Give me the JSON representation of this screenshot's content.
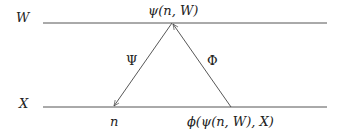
{
  "diagram": {
    "levels": [
      {
        "id": "top",
        "label": "W",
        "y": 23
      },
      {
        "id": "bottom",
        "label": "X",
        "y": 107
      }
    ],
    "nodes": {
      "apex": {
        "label": "ψ(n, W)",
        "x": 172,
        "y": 23
      },
      "left_base": {
        "label": "n",
        "x": 114,
        "y": 107
      },
      "right_base": {
        "label": "ϕ(ψ(n, W), X)",
        "x": 231,
        "y": 107
      }
    },
    "edges": [
      {
        "from": "apex",
        "to": "left_base",
        "label": "Ψ"
      },
      {
        "from": "right_base",
        "to": "apex",
        "label": "Φ"
      }
    ],
    "colors": {
      "line": "#444444",
      "text": "#222222"
    }
  }
}
